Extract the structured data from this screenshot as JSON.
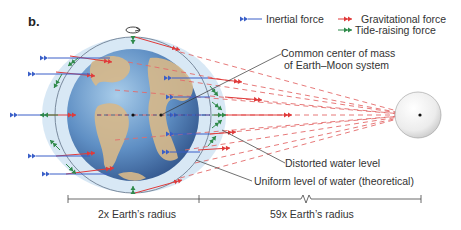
{
  "panel_label": "b.",
  "legend": {
    "inertial": "Inertial force",
    "gravitational": "Gravitational force",
    "tide_raising": "Tide-raising force"
  },
  "labels": {
    "center_of_mass_line1": "Common center of mass",
    "center_of_mass_line2": "of Earth–Moon system",
    "distorted": "Distorted water level",
    "uniform": "Uniform level of water (theoretical)"
  },
  "scale": {
    "earth_segment": "2x Earth’s radius",
    "moon_segment": "59x Earth’s radius"
  },
  "colors": {
    "inertial": "#3a5fc8",
    "gravitational": "#e03a3a",
    "tide": "#2f8a4a",
    "water": "#cfe3f3",
    "text": "#333333"
  }
}
